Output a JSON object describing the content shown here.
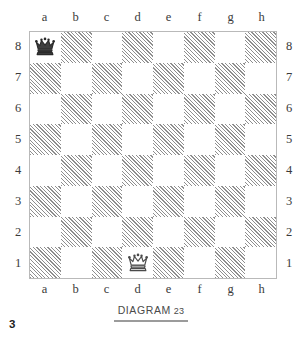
{
  "page": {
    "page_number": "3",
    "background_color": "#ffffff"
  },
  "caption": {
    "text": "DIAGRAM",
    "number": "23",
    "rule_color": "#9b9b9b"
  },
  "board": {
    "files_top": [
      "a",
      "b",
      "c",
      "d",
      "e",
      "f",
      "g",
      "h"
    ],
    "files_bottom": [
      "a",
      "b",
      "c",
      "d",
      "e",
      "f",
      "g",
      "h"
    ],
    "ranks_left": [
      "8",
      "7",
      "6",
      "5",
      "4",
      "3",
      "2",
      "1"
    ],
    "ranks_right": [
      "8",
      "7",
      "6",
      "5",
      "4",
      "3",
      "2",
      "1"
    ],
    "light_square_color": "#ffffff",
    "dark_square_hatch_color": "#8e8e8e",
    "border_color": "#b9b9b9",
    "squares": [
      [
        {
          "id": "a8",
          "shade": "light",
          "piece": "black-queen"
        },
        {
          "id": "b8",
          "shade": "dark",
          "piece": null
        },
        {
          "id": "c8",
          "shade": "light",
          "piece": null
        },
        {
          "id": "d8",
          "shade": "dark",
          "piece": null
        },
        {
          "id": "e8",
          "shade": "light",
          "piece": null
        },
        {
          "id": "f8",
          "shade": "dark",
          "piece": null
        },
        {
          "id": "g8",
          "shade": "light",
          "piece": null
        },
        {
          "id": "h8",
          "shade": "dark",
          "piece": null
        }
      ],
      [
        {
          "id": "a7",
          "shade": "dark",
          "piece": null
        },
        {
          "id": "b7",
          "shade": "light",
          "piece": null
        },
        {
          "id": "c7",
          "shade": "dark",
          "piece": null
        },
        {
          "id": "d7",
          "shade": "light",
          "piece": null
        },
        {
          "id": "e7",
          "shade": "dark",
          "piece": null
        },
        {
          "id": "f7",
          "shade": "light",
          "piece": null
        },
        {
          "id": "g7",
          "shade": "dark",
          "piece": null
        },
        {
          "id": "h7",
          "shade": "light",
          "piece": null
        }
      ],
      [
        {
          "id": "a6",
          "shade": "light",
          "piece": null
        },
        {
          "id": "b6",
          "shade": "dark",
          "piece": null
        },
        {
          "id": "c6",
          "shade": "light",
          "piece": null
        },
        {
          "id": "d6",
          "shade": "dark",
          "piece": null
        },
        {
          "id": "e6",
          "shade": "light",
          "piece": null
        },
        {
          "id": "f6",
          "shade": "dark",
          "piece": null
        },
        {
          "id": "g6",
          "shade": "light",
          "piece": null
        },
        {
          "id": "h6",
          "shade": "dark",
          "piece": null
        }
      ],
      [
        {
          "id": "a5",
          "shade": "dark",
          "piece": null
        },
        {
          "id": "b5",
          "shade": "light",
          "piece": null
        },
        {
          "id": "c5",
          "shade": "dark",
          "piece": null
        },
        {
          "id": "d5",
          "shade": "light",
          "piece": null
        },
        {
          "id": "e5",
          "shade": "dark",
          "piece": null
        },
        {
          "id": "f5",
          "shade": "light",
          "piece": null
        },
        {
          "id": "g5",
          "shade": "dark",
          "piece": null
        },
        {
          "id": "h5",
          "shade": "light",
          "piece": null
        }
      ],
      [
        {
          "id": "a4",
          "shade": "light",
          "piece": null
        },
        {
          "id": "b4",
          "shade": "dark",
          "piece": null
        },
        {
          "id": "c4",
          "shade": "light",
          "piece": null
        },
        {
          "id": "d4",
          "shade": "dark",
          "piece": null
        },
        {
          "id": "e4",
          "shade": "light",
          "piece": null
        },
        {
          "id": "f4",
          "shade": "dark",
          "piece": null
        },
        {
          "id": "g4",
          "shade": "light",
          "piece": null
        },
        {
          "id": "h4",
          "shade": "dark",
          "piece": null
        }
      ],
      [
        {
          "id": "a3",
          "shade": "dark",
          "piece": null
        },
        {
          "id": "b3",
          "shade": "light",
          "piece": null
        },
        {
          "id": "c3",
          "shade": "dark",
          "piece": null
        },
        {
          "id": "d3",
          "shade": "light",
          "piece": null
        },
        {
          "id": "e3",
          "shade": "dark",
          "piece": null
        },
        {
          "id": "f3",
          "shade": "light",
          "piece": null
        },
        {
          "id": "g3",
          "shade": "dark",
          "piece": null
        },
        {
          "id": "h3",
          "shade": "light",
          "piece": null
        }
      ],
      [
        {
          "id": "a2",
          "shade": "light",
          "piece": null
        },
        {
          "id": "b2",
          "shade": "dark",
          "piece": null
        },
        {
          "id": "c2",
          "shade": "light",
          "piece": null
        },
        {
          "id": "d2",
          "shade": "dark",
          "piece": null
        },
        {
          "id": "e2",
          "shade": "light",
          "piece": null
        },
        {
          "id": "f2",
          "shade": "dark",
          "piece": null
        },
        {
          "id": "g2",
          "shade": "light",
          "piece": null
        },
        {
          "id": "h2",
          "shade": "dark",
          "piece": null
        }
      ],
      [
        {
          "id": "a1",
          "shade": "dark",
          "piece": null
        },
        {
          "id": "b1",
          "shade": "light",
          "piece": null
        },
        {
          "id": "c1",
          "shade": "dark",
          "piece": null
        },
        {
          "id": "d1",
          "shade": "light",
          "piece": "white-queen"
        },
        {
          "id": "e1",
          "shade": "dark",
          "piece": null
        },
        {
          "id": "f1",
          "shade": "light",
          "piece": null
        },
        {
          "id": "g1",
          "shade": "dark",
          "piece": null
        },
        {
          "id": "h1",
          "shade": "light",
          "piece": null
        }
      ]
    ],
    "pieces": [
      {
        "square": "a8",
        "type": "queen",
        "color": "black",
        "icon": "black-queen-icon"
      },
      {
        "square": "d1",
        "type": "queen",
        "color": "white",
        "icon": "white-queen-icon"
      }
    ]
  }
}
